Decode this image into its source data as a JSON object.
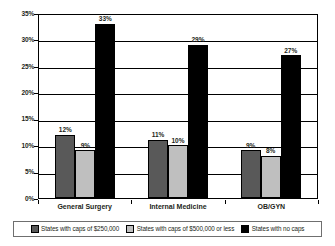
{
  "chart_data": {
    "type": "bar",
    "title": "",
    "subtitle": "",
    "xlabel": "",
    "ylabel": "",
    "ylim": [
      0,
      35
    ],
    "ytick_labels": [
      "0%",
      "5%",
      "10%",
      "15%",
      "20%",
      "25%",
      "30%",
      "35%"
    ],
    "ytick_values": [
      0,
      5,
      10,
      15,
      20,
      25,
      30,
      35
    ],
    "grid": true,
    "legend_position": "bottom",
    "categories": [
      "General Surgery",
      "Internal Medicine",
      "OB/GYN"
    ],
    "series": [
      {
        "name": "States with caps of $250,000",
        "color": "#595959",
        "values": [
          12,
          11,
          9
        ],
        "labels": [
          "12%",
          "11%",
          "9%"
        ]
      },
      {
        "name": "States with caps of $500,000 or less",
        "color": "#bfbfbf",
        "values": [
          9,
          10,
          8
        ],
        "labels": [
          "9%",
          "10%",
          "8%"
        ]
      },
      {
        "name": "States with no caps",
        "color": "#000000",
        "values": [
          33,
          29,
          27
        ],
        "labels": [
          "33%",
          "29%",
          "27%"
        ]
      }
    ]
  },
  "colors": {
    "series_dark_gray": "#595959",
    "series_light_gray": "#bfbfbf",
    "series_black": "#000000",
    "axis": "#000000",
    "gridline": "#000000",
    "text": "#231f20",
    "background": "#ffffff",
    "legend_border": "#6f6f6f"
  }
}
